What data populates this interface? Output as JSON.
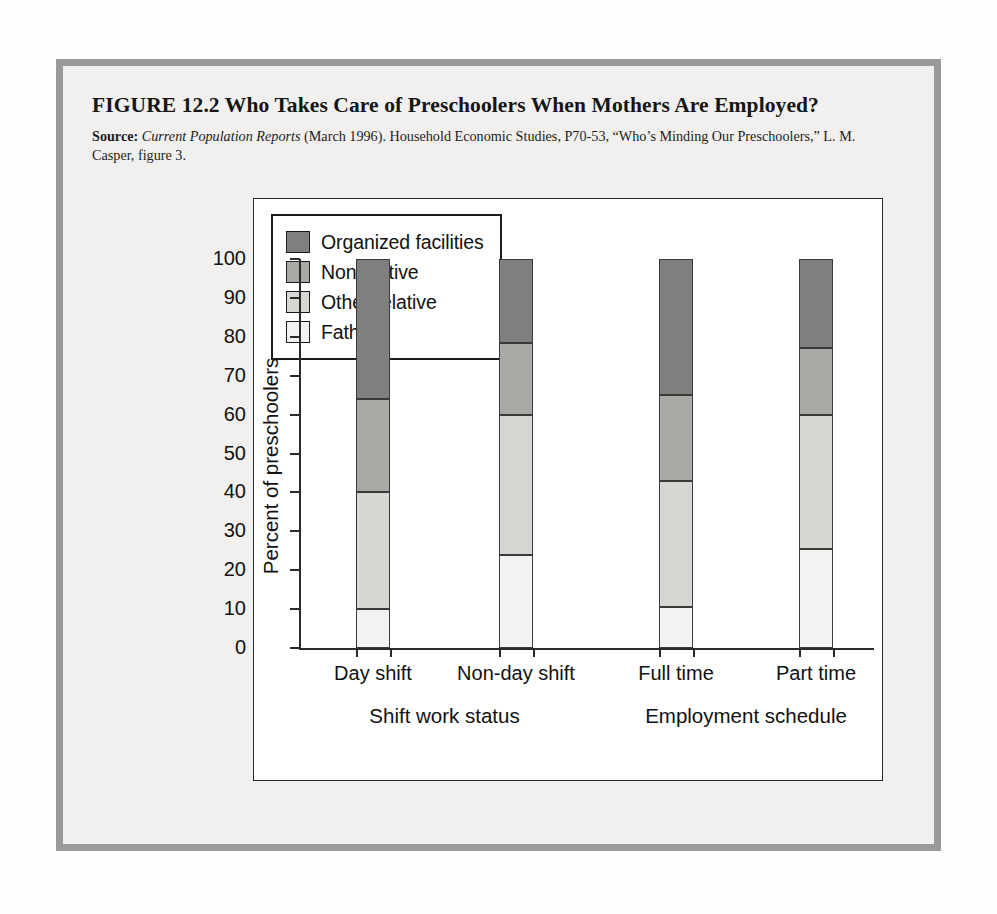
{
  "figure": {
    "title": "FIGURE 12.2  Who Takes Care of Preschoolers When Mothers Are Employed?",
    "source_label": "Source:",
    "source_italic": "Current Population Reports",
    "source_rest": "(March 1996). Household Economic Studies, P70-53, “Who’s Minding Our Preschoolers,” L. M. Casper, figure 3."
  },
  "chart_data": {
    "type": "bar",
    "subtype": "stacked-100",
    "title": "",
    "xlabel": "",
    "ylabel": "Percent of preschoolers",
    "ylim": [
      0,
      100
    ],
    "ytick_step": 10,
    "yticks": [
      0,
      10,
      20,
      30,
      40,
      50,
      60,
      70,
      80,
      90,
      100
    ],
    "ytick_labels": [
      "0",
      "10",
      "20",
      "30",
      "40",
      "50",
      "60",
      "70",
      "80",
      "90",
      "100"
    ],
    "grid": false,
    "legend_position": "top-left-inside",
    "categories": [
      "Day shift",
      "Non-day shift",
      "Full time",
      "Part time"
    ],
    "group_labels": [
      "Shift work status",
      "Employment schedule"
    ],
    "groups": [
      {
        "name": "Shift work status",
        "categories": [
          "Day shift",
          "Non-day shift"
        ]
      },
      {
        "name": "Employment schedule",
        "categories": [
          "Full time",
          "Part time"
        ]
      }
    ],
    "series": [
      {
        "name": "Father",
        "color": "#f2f2f0",
        "values": [
          10.0,
          24.0,
          10.5,
          25.5
        ]
      },
      {
        "name": "Other relative",
        "color": "#d6d6d2",
        "values": [
          30.0,
          36.0,
          32.5,
          34.5
        ]
      },
      {
        "name": "Nonrelative",
        "color": "#a9a9a6",
        "values": [
          24.0,
          18.5,
          22.0,
          17.0
        ]
      },
      {
        "name": "Organized facilities",
        "color": "#7f7f7d",
        "values": [
          36.0,
          21.5,
          35.0,
          23.0
        ]
      }
    ],
    "cumulative_tops": {
      "Day shift": {
        "Father": 10.0,
        "Other relative": 40.0,
        "Nonrelative": 64.0,
        "Organized facilities": 100
      },
      "Non-day shift": {
        "Father": 24.0,
        "Other relative": 60.0,
        "Nonrelative": 78.5,
        "Organized facilities": 100
      },
      "Full time": {
        "Father": 10.5,
        "Other relative": 43.0,
        "Nonrelative": 65.0,
        "Organized facilities": 100
      },
      "Part time": {
        "Father": 25.5,
        "Other relative": 60.0,
        "Nonrelative": 77.0,
        "Organized facilities": 100
      }
    },
    "legend": [
      {
        "label": "Organized facilities",
        "color": "#7f7f7d"
      },
      {
        "label": "Nonrelative",
        "color": "#a9a9a6"
      },
      {
        "label": "Other relative",
        "color": "#d6d6d2"
      },
      {
        "label": "Father",
        "color": "#f2f2f0"
      }
    ]
  },
  "colors": {
    "frame_border": "#9a9a9a",
    "page_bg": "#f1f0ee",
    "panel_bg": "#ffffff",
    "axis": "#2b2b2b",
    "text": "#111111"
  }
}
